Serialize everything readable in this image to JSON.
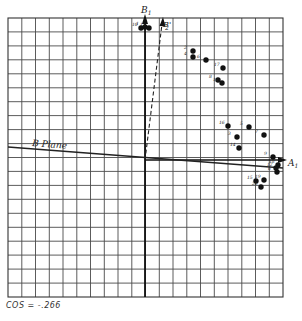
{
  "diagram": {
    "title": "",
    "grid": {
      "columns": 20,
      "rows": 20,
      "left": 8,
      "top": 18,
      "right": 283,
      "bottom": 297
    },
    "origin": {
      "x": 145,
      "y": 160
    },
    "axes": {
      "vertical_label": "B",
      "vertical_label_sub": "1",
      "vertical_prime_label": "B'",
      "vertical_prime_sub": "2",
      "horizontal_label": "A",
      "horizontal_label_sub": "1"
    },
    "plane_label": "B Plane",
    "caption": "COS = -.266",
    "points": [
      {
        "id": "10",
        "x": 141,
        "y": 28
      },
      {
        "id": "1",
        "x": 145,
        "y": 27
      },
      {
        "id": "13",
        "x": 149,
        "y": 28
      },
      {
        "id": "2",
        "x": 193,
        "y": 51
      },
      {
        "id": "4",
        "x": 193,
        "y": 57
      },
      {
        "id": "6",
        "x": 206,
        "y": 60
      },
      {
        "id": "17",
        "x": 223,
        "y": 68
      },
      {
        "id": "8",
        "x": 218,
        "y": 80
      },
      {
        "id": "11",
        "x": 222,
        "y": 83
      },
      {
        "id": "16",
        "x": 228,
        "y": 126
      },
      {
        "id": "5",
        "x": 249,
        "y": 127
      },
      {
        "id": "7",
        "x": 264,
        "y": 135
      },
      {
        "id": "3",
        "x": 237,
        "y": 137
      },
      {
        "id": "14",
        "x": 239,
        "y": 148
      },
      {
        "id": "9",
        "x": 273,
        "y": 157
      },
      {
        "id": "18",
        "x": 278,
        "y": 165
      },
      {
        "id": "12",
        "x": 276,
        "y": 168
      },
      {
        "id": "6b",
        "label": "6",
        "x": 277,
        "y": 172
      },
      {
        "id": "15",
        "x": 256,
        "y": 181
      },
      {
        "id": "19",
        "x": 264,
        "y": 180
      },
      {
        "id": "20",
        "x": 261,
        "y": 187
      }
    ]
  }
}
